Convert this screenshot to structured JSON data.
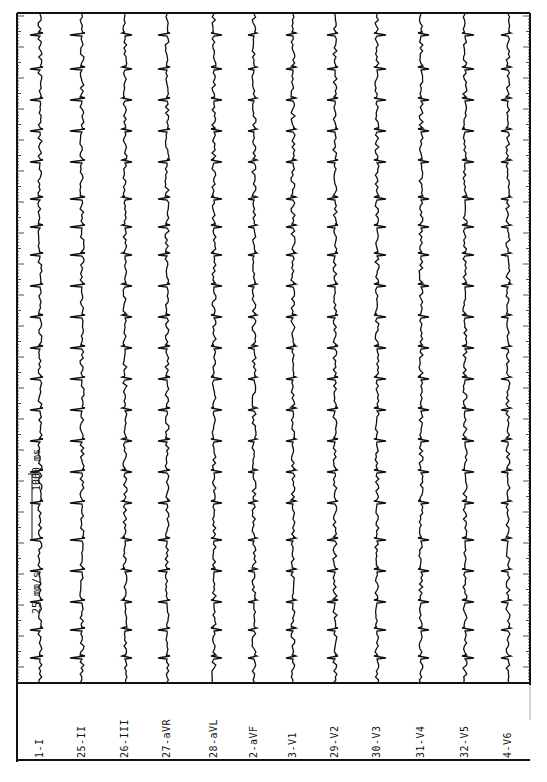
{
  "document": {
    "type": "12-lead ECG tracing (rotated 90°)",
    "paper_speed_label": "25 mm/s",
    "time_marker_label": "1000 ms",
    "colors": {
      "ink": "#111111",
      "paper": "#ffffff"
    }
  },
  "leads": [
    {
      "id": "1-I",
      "x": 40
    },
    {
      "id": "25-II",
      "x": 82
    },
    {
      "id": "26-III",
      "x": 125
    },
    {
      "id": "27-aVR",
      "x": 167
    },
    {
      "id": "28-aVL",
      "x": 214
    },
    {
      "id": "2-aVF",
      "x": 254
    },
    {
      "id": "3-V1",
      "x": 293
    },
    {
      "id": "29-V2",
      "x": 335
    },
    {
      "id": "30-V3",
      "x": 377
    },
    {
      "id": "31-V4",
      "x": 421
    },
    {
      "id": "32-V5",
      "x": 465
    },
    {
      "id": "4-V6",
      "x": 508
    }
  ]
}
